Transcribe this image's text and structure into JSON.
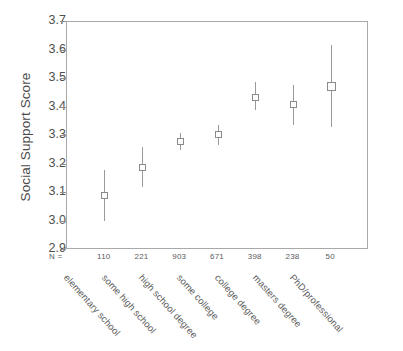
{
  "chart_data": {
    "type": "scatter",
    "title": "",
    "subtitle": "",
    "xlabel": "",
    "ylabel": "Social Support Score",
    "ylim": [
      2.9,
      3.7
    ],
    "ytick_values": [
      3.7,
      3.6,
      3.5,
      3.4,
      3.3,
      3.2,
      3.1,
      3.0,
      2.9
    ],
    "ytick_labels": [
      "3.7",
      "3.6",
      "3.5",
      "3.4",
      "3.3",
      "3.2",
      "3.1",
      "3.0",
      "2.9"
    ],
    "grid": false,
    "legend": null,
    "n_row_label": "N =",
    "categories": [
      "elementary school",
      "some high school",
      "high school degree",
      "some college",
      "college degree",
      "masters degree",
      "PhD/professional"
    ],
    "n_values": [
      "110",
      "221",
      "903",
      "671",
      "398",
      "238",
      "50"
    ],
    "series": [
      {
        "name": "mean with 95% CI",
        "values": [
          3.09,
          3.19,
          3.28,
          3.305,
          3.435,
          3.41,
          3.475
        ],
        "ci_lower": [
          3.0,
          3.12,
          3.25,
          3.27,
          3.39,
          3.34,
          3.33
        ],
        "ci_upper": [
          3.18,
          3.26,
          3.31,
          3.34,
          3.49,
          3.48,
          3.62
        ]
      }
    ],
    "marker_shape": "square-open",
    "marker_color": "#8a8a8a",
    "line_color": "#9a9a9a",
    "axis_color": "#a9a9a9"
  }
}
